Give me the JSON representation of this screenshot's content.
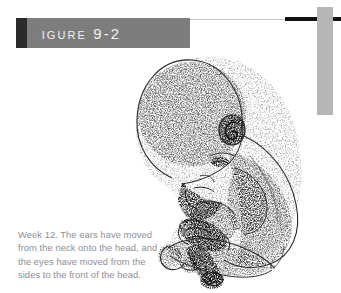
{
  "figure": {
    "banner_label": "Figure 9-2",
    "banner_bg_color": "#7d7d7d",
    "banner_block_color": "#2b2b2b",
    "rule_color": "#111111",
    "side_bar_color": "#b6b6b6"
  },
  "caption": {
    "text": "Week 12. The ears have moved from the neck onto the head, and the eyes have moved from the sides to the front of the head.",
    "color": "#8e8e96"
  },
  "illustration": {
    "name": "fetus-week-12-stipple-drawing",
    "description": "Stippled pen-and-ink drawing of a 12-week fetus curled in the fetal position, large head at upper left, arms and hands folded in front of the chest, knees drawn up and feet crossed at lower center.",
    "ink_color": "#1a1a1a"
  }
}
